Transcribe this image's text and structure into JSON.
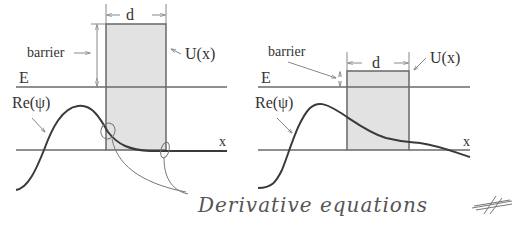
{
  "figure": {
    "left_panel": {
      "labels": {
        "barrier": "barrier",
        "width": "d",
        "potential": "U(x)",
        "energy": "E",
        "wavefunction": "Re(ψ)",
        "axis": "x"
      },
      "case": "high barrier (E much less than U), wave decays inside barrier"
    },
    "right_panel": {
      "labels": {
        "barrier": "barrier",
        "width": "d",
        "potential": "U(x)",
        "energy": "E",
        "wavefunction": "Re(ψ)",
        "axis": "x"
      },
      "case": "low barrier (E slightly less than U), wave tunnels through"
    },
    "annotation": {
      "text": "Derivative equations",
      "note": "handwritten, with circled boundary points on left panel"
    },
    "colors": {
      "barrier_fill": "#e2e2e2",
      "lines": "#6a6a6a",
      "curve": "#3a3a3a",
      "pencil": "#777777"
    }
  }
}
